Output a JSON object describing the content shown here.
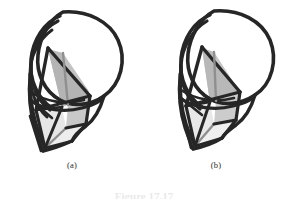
{
  "figure": {
    "background_color": "#ffffff",
    "ink_color": "#262626",
    "mid_gray_fill": "#b4b4b4",
    "light_gray_fill": "#e0e0e0",
    "pale_gray_fill": "#ededed",
    "seam_gray": "#8c8c8c",
    "caption_text": "Figure 17.17",
    "panels": [
      {
        "id": "a",
        "label": "(a)",
        "description": "hand-drawn sphere with inscribed polyhedral surface, extra nested arcs on left"
      },
      {
        "id": "b",
        "label": "(b)",
        "description": "hand-drawn sphere with inscribed polyhedral surface, fewer nested arcs"
      }
    ]
  }
}
